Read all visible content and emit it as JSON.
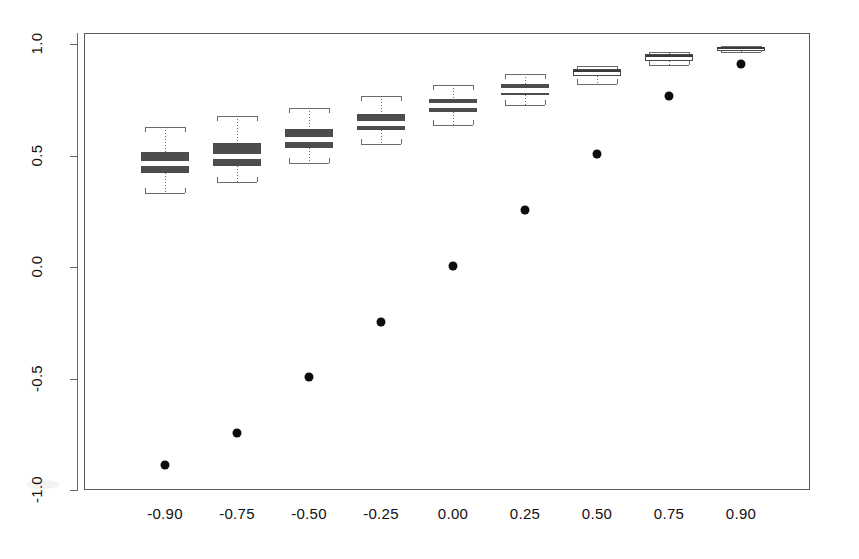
{
  "chart_data": {
    "type": "box",
    "title": "",
    "xlabel": "",
    "ylabel": "",
    "categories": [
      "-0.90",
      "-0.75",
      "-0.50",
      "-0.25",
      "0.00",
      "0.25",
      "0.50",
      "0.75",
      "0.90"
    ],
    "x_tick_labels": [
      "-0.90",
      "-0.75",
      "-0.50",
      "-0.25",
      "0.00",
      "0.25",
      "0.50",
      "0.75",
      "0.90"
    ],
    "y_tick_labels": [
      "1.0",
      "0.5",
      "0.0",
      "-0.5",
      "-1.0"
    ],
    "y_ticks": [
      1.0,
      0.5,
      0.0,
      -0.5,
      -1.0
    ],
    "ylim": [
      -1.1,
      1.12
    ],
    "grid": false,
    "legend": null,
    "boxes": [
      {
        "category": "-0.90",
        "whisker_low": 0.33,
        "q1": 0.42,
        "median": 0.465,
        "q3": 0.515,
        "whisker_high": 0.63,
        "fill": "dark",
        "median_color": "white"
      },
      {
        "category": "-0.75",
        "whisker_low": 0.38,
        "q1": 0.455,
        "median": 0.5,
        "q3": 0.555,
        "whisker_high": 0.675,
        "fill": "dark",
        "median_color": "white"
      },
      {
        "category": "-0.50",
        "whisker_low": 0.465,
        "q1": 0.535,
        "median": 0.575,
        "q3": 0.62,
        "whisker_high": 0.715,
        "fill": "dark",
        "median_color": "white"
      },
      {
        "category": "-0.25",
        "whisker_low": 0.55,
        "q1": 0.615,
        "median": 0.645,
        "q3": 0.685,
        "whisker_high": 0.765,
        "fill": "dark",
        "median_color": "white"
      },
      {
        "category": "0.00",
        "whisker_low": 0.635,
        "q1": 0.695,
        "median": 0.725,
        "q3": 0.755,
        "whisker_high": 0.815,
        "fill": "dark",
        "median_color": "white"
      },
      {
        "category": "0.25",
        "whisker_low": 0.725,
        "q1": 0.77,
        "median": 0.795,
        "q3": 0.82,
        "whisker_high": 0.865,
        "fill": "dark",
        "median_color": "white"
      },
      {
        "category": "0.50",
        "whisker_low": 0.82,
        "q1": 0.855,
        "median": 0.875,
        "q3": 0.89,
        "whisker_high": 0.9,
        "fill": "light",
        "median_color": "dark"
      },
      {
        "category": "0.75",
        "whisker_low": 0.905,
        "q1": 0.925,
        "median": 0.94,
        "q3": 0.955,
        "whisker_high": 0.965,
        "fill": "light",
        "median_color": "dark"
      },
      {
        "category": "0.90",
        "whisker_low": 0.965,
        "q1": 0.972,
        "median": 0.978,
        "q3": 0.985,
        "whisker_high": 0.99,
        "fill": "light",
        "median_color": "dark"
      }
    ],
    "points": [
      {
        "category": "-0.90",
        "value": -0.89
      },
      {
        "category": "-0.75",
        "value": -0.745
      },
      {
        "category": "-0.50",
        "value": -0.495
      },
      {
        "category": "-0.25",
        "value": -0.245
      },
      {
        "category": "0.00",
        "value": 0.005
      },
      {
        "category": "0.25",
        "value": 0.255
      },
      {
        "category": "0.50",
        "value": 0.505
      },
      {
        "category": "0.75",
        "value": 0.765
      },
      {
        "category": "0.90",
        "value": 0.91
      }
    ],
    "colors": {
      "box_dark": "#4d4d4d",
      "box_light": "#ffffff",
      "outline": "#4a4a4a",
      "whisker": "#6a6a6a",
      "point": "#0d0d0d",
      "axis": "#5a5a5a",
      "text": "#111111"
    }
  }
}
